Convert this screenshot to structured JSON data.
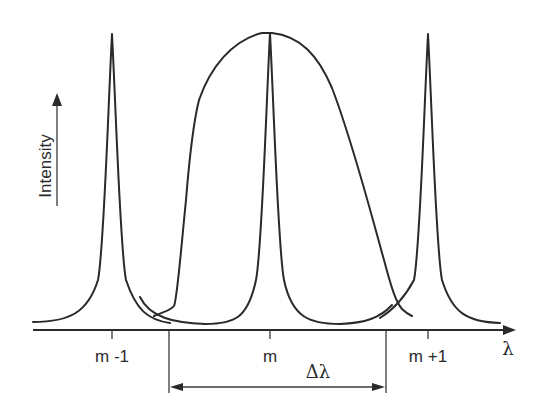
{
  "diagram": {
    "title": "",
    "y_axis_label": "Intensity",
    "x_axis_label": "λ",
    "tick_labels": [
      "m -1",
      "m",
      "m +1"
    ],
    "interval_label": "Δλ",
    "elements": {
      "narrow_peaks": [
        {
          "order": "m -1",
          "description": "narrow transmission peak"
        },
        {
          "order": "m",
          "description": "narrow transmission peak"
        },
        {
          "order": "m +1",
          "description": "narrow transmission peak"
        }
      ],
      "broad_envelope": {
        "description": "broad spectral envelope centered on order m, extending roughly across Δλ"
      },
      "free_spectral_range": {
        "label": "Δλ",
        "description": "double-headed arrow spanning the width between two vertical markers"
      }
    },
    "colors": {
      "line": "#2a2a2a",
      "background": "#ffffff"
    }
  }
}
